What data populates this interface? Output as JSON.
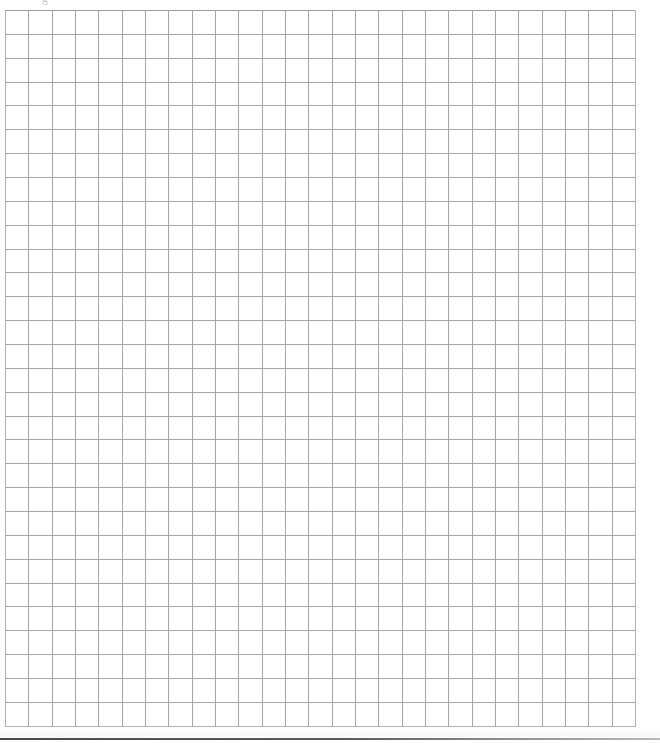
{
  "page": {
    "width": 660,
    "height": 743,
    "background_color": "#ffffff"
  },
  "top_glyph": {
    "text": "g",
    "note": "faint partially-cropped character at top edge",
    "color": "#c8c8c8"
  },
  "grid": {
    "columns": 27,
    "rows": 30,
    "line_color": "#a6a6a6",
    "cell_background": "#ffffff",
    "left": 5,
    "top": 10,
    "width": 631,
    "height": 717,
    "cells": [
      [
        "",
        "",
        "",
        "",
        "",
        "",
        "",
        "",
        "",
        "",
        "",
        "",
        "",
        "",
        "",
        "",
        "",
        "",
        "",
        "",
        "",
        "",
        "",
        "",
        "",
        "",
        ""
      ],
      [
        "",
        "",
        "",
        "",
        "",
        "",
        "",
        "",
        "",
        "",
        "",
        "",
        "",
        "",
        "",
        "",
        "",
        "",
        "",
        "",
        "",
        "",
        "",
        "",
        "",
        "",
        ""
      ],
      [
        "",
        "",
        "",
        "",
        "",
        "",
        "",
        "",
        "",
        "",
        "",
        "",
        "",
        "",
        "",
        "",
        "",
        "",
        "",
        "",
        "",
        "",
        "",
        "",
        "",
        "",
        ""
      ],
      [
        "",
        "",
        "",
        "",
        "",
        "",
        "",
        "",
        "",
        "",
        "",
        "",
        "",
        "",
        "",
        "",
        "",
        "",
        "",
        "",
        "",
        "",
        "",
        "",
        "",
        "",
        ""
      ],
      [
        "",
        "",
        "",
        "",
        "",
        "",
        "",
        "",
        "",
        "",
        "",
        "",
        "",
        "",
        "",
        "",
        "",
        "",
        "",
        "",
        "",
        "",
        "",
        "",
        "",
        "",
        ""
      ],
      [
        "",
        "",
        "",
        "",
        "",
        "",
        "",
        "",
        "",
        "",
        "",
        "",
        "",
        "",
        "",
        "",
        "",
        "",
        "",
        "",
        "",
        "",
        "",
        "",
        "",
        "",
        ""
      ],
      [
        "",
        "",
        "",
        "",
        "",
        "",
        "",
        "",
        "",
        "",
        "",
        "",
        "",
        "",
        "",
        "",
        "",
        "",
        "",
        "",
        "",
        "",
        "",
        "",
        "",
        "",
        ""
      ],
      [
        "",
        "",
        "",
        "",
        "",
        "",
        "",
        "",
        "",
        "",
        "",
        "",
        "",
        "",
        "",
        "",
        "",
        "",
        "",
        "",
        "",
        "",
        "",
        "",
        "",
        "",
        ""
      ],
      [
        "",
        "",
        "",
        "",
        "",
        "",
        "",
        "",
        "",
        "",
        "",
        "",
        "",
        "",
        "",
        "",
        "",
        "",
        "",
        "",
        "",
        "",
        "",
        "",
        "",
        "",
        ""
      ],
      [
        "",
        "",
        "",
        "",
        "",
        "",
        "",
        "",
        "",
        "",
        "",
        "",
        "",
        "",
        "",
        "",
        "",
        "",
        "",
        "",
        "",
        "",
        "",
        "",
        "",
        "",
        ""
      ],
      [
        "",
        "",
        "",
        "",
        "",
        "",
        "",
        "",
        "",
        "",
        "",
        "",
        "",
        "",
        "",
        "",
        "",
        "",
        "",
        "",
        "",
        "",
        "",
        "",
        "",
        "",
        ""
      ],
      [
        "",
        "",
        "",
        "",
        "",
        "",
        "",
        "",
        "",
        "",
        "",
        "",
        "",
        "",
        "",
        "",
        "",
        "",
        "",
        "",
        "",
        "",
        "",
        "",
        "",
        "",
        ""
      ],
      [
        "",
        "",
        "",
        "",
        "",
        "",
        "",
        "",
        "",
        "",
        "",
        "",
        "",
        "",
        "",
        "",
        "",
        "",
        "",
        "",
        "",
        "",
        "",
        "",
        "",
        "",
        ""
      ],
      [
        "",
        "",
        "",
        "",
        "",
        "",
        "",
        "",
        "",
        "",
        "",
        "",
        "",
        "",
        "",
        "",
        "",
        "",
        "",
        "",
        "",
        "",
        "",
        "",
        "",
        "",
        ""
      ],
      [
        "",
        "",
        "",
        "",
        "",
        "",
        "",
        "",
        "",
        "",
        "",
        "",
        "",
        "",
        "",
        "",
        "",
        "",
        "",
        "",
        "",
        "",
        "",
        "",
        "",
        "",
        ""
      ],
      [
        "",
        "",
        "",
        "",
        "",
        "",
        "",
        "",
        "",
        "",
        "",
        "",
        "",
        "",
        "",
        "",
        "",
        "",
        "",
        "",
        "",
        "",
        "",
        "",
        "",
        "",
        ""
      ],
      [
        "",
        "",
        "",
        "",
        "",
        "",
        "",
        "",
        "",
        "",
        "",
        "",
        "",
        "",
        "",
        "",
        "",
        "",
        "",
        "",
        "",
        "",
        "",
        "",
        "",
        "",
        ""
      ],
      [
        "",
        "",
        "",
        "",
        "",
        "",
        "",
        "",
        "",
        "",
        "",
        "",
        "",
        "",
        "",
        "",
        "",
        "",
        "",
        "",
        "",
        "",
        "",
        "",
        "",
        "",
        ""
      ],
      [
        "",
        "",
        "",
        "",
        "",
        "",
        "",
        "",
        "",
        "",
        "",
        "",
        "",
        "",
        "",
        "",
        "",
        "",
        "",
        "",
        "",
        "",
        "",
        "",
        "",
        "",
        ""
      ],
      [
        "",
        "",
        "",
        "",
        "",
        "",
        "",
        "",
        "",
        "",
        "",
        "",
        "",
        "",
        "",
        "",
        "",
        "",
        "",
        "",
        "",
        "",
        "",
        "",
        "",
        "",
        ""
      ],
      [
        "",
        "",
        "",
        "",
        "",
        "",
        "",
        "",
        "",
        "",
        "",
        "",
        "",
        "",
        "",
        "",
        "",
        "",
        "",
        "",
        "",
        "",
        "",
        "",
        "",
        "",
        ""
      ],
      [
        "",
        "",
        "",
        "",
        "",
        "",
        "",
        "",
        "",
        "",
        "",
        "",
        "",
        "",
        "",
        "",
        "",
        "",
        "",
        "",
        "",
        "",
        "",
        "",
        "",
        "",
        ""
      ],
      [
        "",
        "",
        "",
        "",
        "",
        "",
        "",
        "",
        "",
        "",
        "",
        "",
        "",
        "",
        "",
        "",
        "",
        "",
        "",
        "",
        "",
        "",
        "",
        "",
        "",
        "",
        ""
      ],
      [
        "",
        "",
        "",
        "",
        "",
        "",
        "",
        "",
        "",
        "",
        "",
        "",
        "",
        "",
        "",
        "",
        "",
        "",
        "",
        "",
        "",
        "",
        "",
        "",
        "",
        "",
        ""
      ],
      [
        "",
        "",
        "",
        "",
        "",
        "",
        "",
        "",
        "",
        "",
        "",
        "",
        "",
        "",
        "",
        "",
        "",
        "",
        "",
        "",
        "",
        "",
        "",
        "",
        "",
        "",
        ""
      ],
      [
        "",
        "",
        "",
        "",
        "",
        "",
        "",
        "",
        "",
        "",
        "",
        "",
        "",
        "",
        "",
        "",
        "",
        "",
        "",
        "",
        "",
        "",
        "",
        "",
        "",
        "",
        ""
      ],
      [
        "",
        "",
        "",
        "",
        "",
        "",
        "",
        "",
        "",
        "",
        "",
        "",
        "",
        "",
        "",
        "",
        "",
        "",
        "",
        "",
        "",
        "",
        "",
        "",
        "",
        "",
        ""
      ],
      [
        "",
        "",
        "",
        "",
        "",
        "",
        "",
        "",
        "",
        "",
        "",
        "",
        "",
        "",
        "",
        "",
        "",
        "",
        "",
        "",
        "",
        "",
        "",
        "",
        "",
        "",
        ""
      ],
      [
        "",
        "",
        "",
        "",
        "",
        "",
        "",
        "",
        "",
        "",
        "",
        "",
        "",
        "",
        "",
        "",
        "",
        "",
        "",
        "",
        "",
        "",
        "",
        "",
        "",
        "",
        ""
      ],
      [
        "",
        "",
        "",
        "",
        "",
        "",
        "",
        "",
        "",
        "",
        "",
        "",
        "",
        "",
        "",
        "",
        "",
        "",
        "",
        "",
        "",
        "",
        "",
        "",
        "",
        "",
        ""
      ]
    ]
  },
  "footer_rule": {
    "color": "#4a4a4a",
    "top": 738,
    "height": 2
  }
}
